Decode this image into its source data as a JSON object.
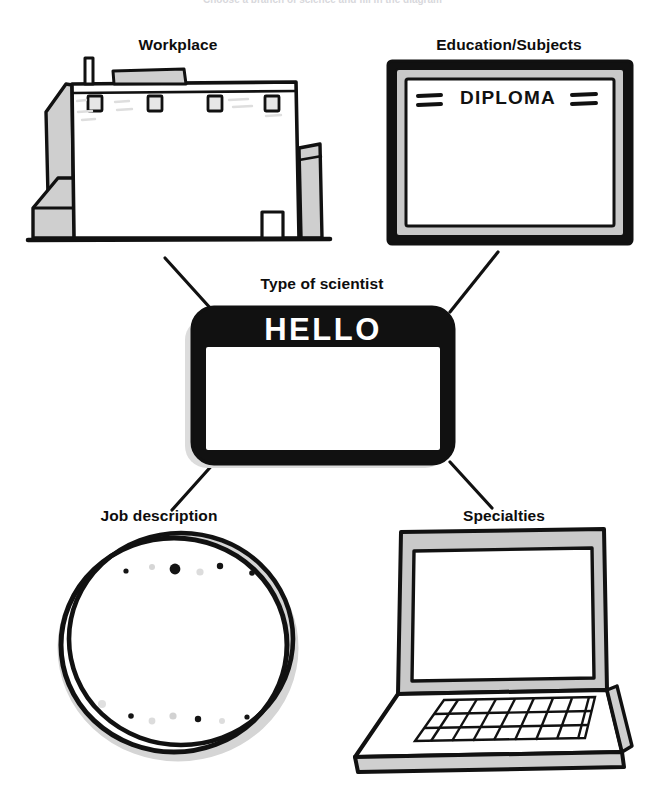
{
  "page": {
    "header_text": "Choose a branch of science and fill in the diagram",
    "background_color": "#ffffff",
    "ink_color": "#111111",
    "shade_color": "#c9c9c9",
    "light_shade_color": "#e2e2e2",
    "width": 645,
    "height": 797
  },
  "center": {
    "label": "Type of scientist",
    "badge_text": "HELLO",
    "badge_fill": "#111111",
    "badge_panel_fill": "#ffffff"
  },
  "nodes": [
    {
      "id": "workplace",
      "label": "Workplace",
      "icon": "factory-building-icon",
      "position": "top-left"
    },
    {
      "id": "education",
      "label": "Education/Subjects",
      "icon": "framed-diploma-icon",
      "frame_text": "DIPLOMA",
      "position": "top-right"
    },
    {
      "id": "job-description",
      "label": "Job description",
      "icon": "petri-dish-icon",
      "position": "bottom-left"
    },
    {
      "id": "specialties",
      "label": "Specialties",
      "icon": "laptop-icon",
      "position": "bottom-right"
    }
  ],
  "connectors": [
    {
      "from": "workplace",
      "to": "center"
    },
    {
      "from": "education",
      "to": "center"
    },
    {
      "from": "center",
      "to": "job-description"
    },
    {
      "from": "center",
      "to": "specialties"
    }
  ],
  "petri_dish": {
    "colony_dots": [
      {
        "cx": 126,
        "cy": 571,
        "r": 2.6,
        "fill": "#141414"
      },
      {
        "cx": 152,
        "cy": 567,
        "r": 3.0,
        "fill": "#d6d6d6"
      },
      {
        "cx": 175,
        "cy": 569,
        "r": 5.4,
        "fill": "#141414"
      },
      {
        "cx": 200,
        "cy": 572,
        "r": 3.6,
        "fill": "#dcdcdc"
      },
      {
        "cx": 220,
        "cy": 566,
        "r": 3.2,
        "fill": "#141414"
      },
      {
        "cx": 252,
        "cy": 573,
        "r": 2.8,
        "fill": "#141414"
      },
      {
        "cx": 102,
        "cy": 704,
        "r": 4.0,
        "fill": "#e0e0e0"
      },
      {
        "cx": 131,
        "cy": 716,
        "r": 2.8,
        "fill": "#141414"
      },
      {
        "cx": 152,
        "cy": 721,
        "r": 3.4,
        "fill": "#dcdcdc"
      },
      {
        "cx": 173,
        "cy": 716,
        "r": 3.6,
        "fill": "#d2d2d2"
      },
      {
        "cx": 198,
        "cy": 719,
        "r": 3.2,
        "fill": "#141414"
      },
      {
        "cx": 222,
        "cy": 721,
        "r": 3.0,
        "fill": "#dddddd"
      },
      {
        "cx": 247,
        "cy": 717,
        "r": 2.6,
        "fill": "#141414"
      }
    ]
  }
}
